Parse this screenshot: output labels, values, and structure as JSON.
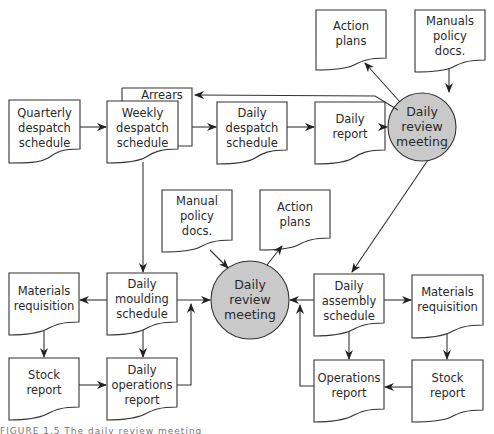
{
  "diagram": {
    "type": "flowchart",
    "colors": {
      "line": "#333333",
      "doc_fill": "#ffffff",
      "meeting_fill": "#c9c9c9"
    },
    "nodes": {
      "quarterly_despatch": {
        "label_lines": [
          "Quarterly",
          "despatch",
          "schedule"
        ],
        "shape": "document"
      },
      "arrears": {
        "label": "Arrears",
        "shape": "document-stacked"
      },
      "weekly_despatch": {
        "label_lines": [
          "Weekly",
          "despatch",
          "schedule"
        ],
        "shape": "document"
      },
      "daily_despatch": {
        "label_lines": [
          "Daily",
          "despatch",
          "schedule"
        ],
        "shape": "document"
      },
      "daily_report": {
        "label_lines": [
          "Daily",
          "report"
        ],
        "shape": "document"
      },
      "action_plans_top": {
        "label_lines": [
          "Action",
          "plans"
        ],
        "shape": "document"
      },
      "manuals_policy_top": {
        "label_lines": [
          "Manuals",
          "policy",
          "docs."
        ],
        "shape": "document"
      },
      "meeting_top": {
        "label_lines": [
          "Daily",
          "review",
          "meeting"
        ],
        "shape": "circle"
      },
      "manual_policy_mid": {
        "label_lines": [
          "Manual",
          "policy",
          "docs."
        ],
        "shape": "document"
      },
      "action_plans_mid": {
        "label_lines": [
          "Action",
          "plans"
        ],
        "shape": "document"
      },
      "meeting_mid": {
        "label_lines": [
          "Daily",
          "review",
          "meeting"
        ],
        "shape": "circle"
      },
      "daily_moulding": {
        "label_lines": [
          "Daily",
          "moulding",
          "schedule"
        ],
        "shape": "document"
      },
      "materials_req_left": {
        "label_lines": [
          "Materials",
          "requisition"
        ],
        "shape": "document"
      },
      "stock_report_left": {
        "label_lines": [
          "Stock",
          "report"
        ],
        "shape": "document"
      },
      "daily_operations": {
        "label_lines": [
          "Daily",
          "operations",
          "report"
        ],
        "shape": "document"
      },
      "daily_assembly": {
        "label_lines": [
          "Daily",
          "assembly",
          "schedule"
        ],
        "shape": "document"
      },
      "materials_req_right": {
        "label_lines": [
          "Materials",
          "requisition"
        ],
        "shape": "document"
      },
      "operations_report": {
        "label_lines": [
          "Operations",
          "report"
        ],
        "shape": "document"
      },
      "stock_report_right": {
        "label_lines": [
          "Stock",
          "report"
        ],
        "shape": "document"
      }
    },
    "edges": [
      {
        "from": "quarterly_despatch",
        "to": "weekly_despatch"
      },
      {
        "from": "weekly_despatch",
        "to": "daily_despatch"
      },
      {
        "from": "daily_despatch",
        "to": "daily_report"
      },
      {
        "from": "daily_report",
        "to": "meeting_top"
      },
      {
        "from": "meeting_top",
        "to": "action_plans_top"
      },
      {
        "from": "manuals_policy_top",
        "to": "meeting_top"
      },
      {
        "from": "meeting_top",
        "to": "arrears"
      },
      {
        "from": "meeting_top",
        "to": "daily_assembly"
      },
      {
        "from": "weekly_despatch",
        "to": "daily_moulding"
      },
      {
        "from": "manual_policy_mid",
        "to": "meeting_mid"
      },
      {
        "from": "meeting_mid",
        "to": "action_plans_mid"
      },
      {
        "from": "daily_moulding",
        "to": "meeting_mid"
      },
      {
        "from": "daily_moulding",
        "to": "materials_req_left"
      },
      {
        "from": "daily_moulding",
        "to": "daily_operations"
      },
      {
        "from": "materials_req_left",
        "to": "stock_report_left"
      },
      {
        "from": "stock_report_left",
        "to": "daily_operations"
      },
      {
        "from": "daily_operations",
        "to": "meeting_mid"
      },
      {
        "from": "daily_assembly",
        "to": "meeting_mid"
      },
      {
        "from": "daily_assembly",
        "to": "materials_req_right"
      },
      {
        "from": "daily_assembly",
        "to": "operations_report"
      },
      {
        "from": "materials_req_right",
        "to": "stock_report_right"
      },
      {
        "from": "stock_report_right",
        "to": "operations_report"
      },
      {
        "from": "operations_report",
        "to": "meeting_mid"
      }
    ]
  },
  "caption": {
    "text": "FIGURE 1.5   The daily review meeting"
  }
}
